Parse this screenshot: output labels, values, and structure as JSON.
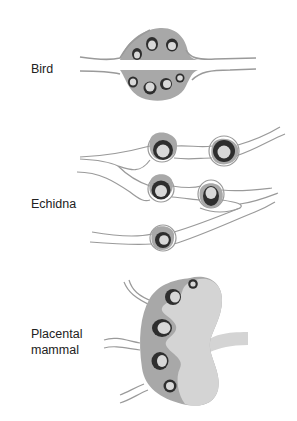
{
  "labels": {
    "bird": "Bird",
    "echidna": "Echidna",
    "placental_line1": "Placental",
    "placental_line2": "mammal"
  },
  "colors": {
    "background": "#ffffff",
    "stroma": "#a8a8a8",
    "follicle_ring": "#2e2e2e",
    "oocyte": "#d8d8d8",
    "medulla": "#d4d4d4",
    "duct_line": "#9a9a9a"
  },
  "panels": [
    {
      "id": "bird",
      "label": "Bird",
      "follicle_count": 7
    },
    {
      "id": "echidna",
      "label": "Echidna",
      "follicle_count": 5
    },
    {
      "id": "placental",
      "label": "Placental mammal",
      "follicle_count": 5
    }
  ]
}
